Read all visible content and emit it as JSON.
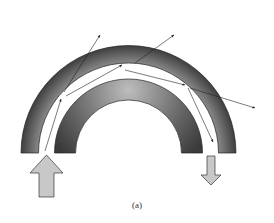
{
  "figure": {
    "caption": "(a)"
  },
  "colors": {
    "ring_dark": "#3a3a3a",
    "ring_light": "#9a9a9a",
    "arrow_fill": "#c8c8c8",
    "ray": "#222222",
    "background": "#ffffff"
  },
  "geometry": {
    "center": [
      128.5,
      153
    ],
    "outer_ring": {
      "r_outer": 107.5,
      "r_inner": 90
    },
    "inner_ring": {
      "r_outer": 74,
      "r_inner": 53
    },
    "input_arrow": "up",
    "output_arrow": "down"
  },
  "rays": [
    {
      "from": [
        45,
        151
      ],
      "to": [
        61,
        99
      ],
      "type": "guided"
    },
    {
      "from": [
        66,
        96
      ],
      "to": [
        122,
        65
      ],
      "type": "guided"
    },
    {
      "from": [
        64,
        92
      ],
      "to": [
        100,
        35
      ],
      "type": "escaping"
    },
    {
      "from": [
        125,
        70
      ],
      "to": [
        185,
        85
      ],
      "type": "guided"
    },
    {
      "from": [
        135,
        63
      ],
      "to": [
        174,
        35
      ],
      "type": "escaping"
    },
    {
      "from": [
        188,
        88
      ],
      "to": [
        213,
        142
      ],
      "type": "guided"
    },
    {
      "from": [
        190,
        88
      ],
      "to": [
        255,
        108
      ],
      "type": "escaping"
    }
  ]
}
